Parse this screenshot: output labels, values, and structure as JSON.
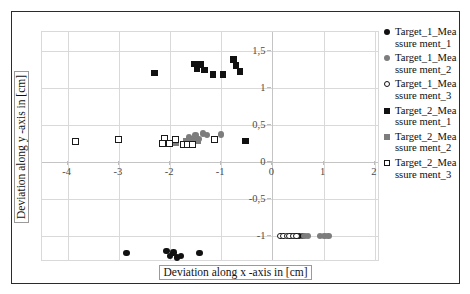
{
  "chart_data": {
    "type": "scatter",
    "title": "",
    "xlabel": "Deviation along x -axis in [cm]",
    "ylabel": "Deviation along y -axis in [cm]",
    "xlim": [
      -4.5,
      2.1
    ],
    "ylim": [
      -1.35,
      1.75
    ],
    "xticks": [
      -4,
      -3,
      -2,
      -1,
      0,
      1,
      2
    ],
    "xticklabels": [
      "-4",
      "-3",
      "-2",
      "-1",
      "0",
      "1",
      "2"
    ],
    "yticks": [
      -1,
      -0.5,
      0,
      0.5,
      1,
      1.5
    ],
    "yticklabels": [
      "-1",
      "-0,5",
      "0",
      "0,5",
      "1",
      "1,5"
    ],
    "grid": true,
    "legend_position": "right",
    "series": [
      {
        "name": "Target_1_Meassurement_1",
        "label": "Target_1_Meassurement_1",
        "marker": "circle-filled-black",
        "color": "#111111",
        "size": 6.5,
        "points": [
          [
            -2.85,
            -1.23
          ],
          [
            -2.07,
            -1.2
          ],
          [
            -2.0,
            -1.27
          ],
          [
            -1.93,
            -1.22
          ],
          [
            -1.86,
            -1.29
          ],
          [
            -1.79,
            -1.27
          ],
          [
            -1.42,
            -1.23
          ],
          [
            0.36,
            -1.0
          ],
          [
            0.45,
            -1.0
          ],
          [
            0.52,
            -1.0
          ],
          [
            0.6,
            -1.0
          ]
        ]
      },
      {
        "name": "Target_1_Meassurement_2",
        "label": "Target_1_Meassurement_2",
        "marker": "circle-filled-gray",
        "color": "#7d7d7d",
        "size": 6.5,
        "points": [
          [
            0.63,
            -1.0
          ],
          [
            0.69,
            -1.0
          ],
          [
            0.93,
            -1.0
          ],
          [
            1.02,
            -1.0
          ],
          [
            1.09,
            -1.0
          ],
          [
            -1.63,
            0.33
          ],
          [
            -1.57,
            0.3
          ],
          [
            -1.5,
            0.36
          ],
          [
            -1.44,
            0.31
          ],
          [
            -1.36,
            0.38
          ],
          [
            -1.28,
            0.36
          ],
          [
            -1.0,
            0.37
          ]
        ]
      },
      {
        "name": "Target_1_Meassurement_3",
        "label": "Target_1_Meassurement_3",
        "marker": "circle-open",
        "color": "#1a1a1a",
        "size": 6.5,
        "points": [
          [
            0.16,
            -1.0
          ],
          [
            0.22,
            -1.0
          ],
          [
            0.28,
            -1.0
          ],
          [
            0.33,
            -1.0
          ],
          [
            0.4,
            -1.0
          ],
          [
            0.47,
            -1.0
          ]
        ]
      },
      {
        "name": "Target_2_Meassurement_1",
        "label": "Target_2_Meassurement_1",
        "marker": "square-filled-black",
        "color": "#111111",
        "size": 6.5,
        "points": [
          [
            -2.3,
            1.2
          ],
          [
            -1.52,
            1.32
          ],
          [
            -1.47,
            1.25
          ],
          [
            -1.4,
            1.31
          ],
          [
            -1.33,
            1.24
          ],
          [
            -1.16,
            1.18
          ],
          [
            -0.97,
            1.18
          ],
          [
            -0.76,
            1.38
          ],
          [
            -0.71,
            1.3
          ],
          [
            -0.63,
            1.22
          ],
          [
            -0.53,
            0.28
          ]
        ]
      },
      {
        "name": "Target_2_Meassurement_2",
        "label": "Target_2_Meassurement_2",
        "marker": "square-filled-gray",
        "color": "#7d7d7d",
        "size": 6.5,
        "points": [
          [
            -1.68,
            0.28
          ],
          [
            -1.6,
            0.3
          ],
          [
            -1.53,
            0.3
          ],
          [
            -1.46,
            0.28
          ],
          [
            -1.88,
            0.26
          ]
        ]
      },
      {
        "name": "Target_2_Meassurement_3",
        "label": "Target_2_Meassurement_3",
        "marker": "square-open",
        "color": "#1a1a1a",
        "size": 7,
        "points": [
          [
            -3.84,
            0.27
          ],
          [
            -3.0,
            0.3
          ],
          [
            -2.1,
            0.31
          ],
          [
            -2.15,
            0.25
          ],
          [
            -2.01,
            0.25
          ],
          [
            -1.9,
            0.3
          ],
          [
            -1.74,
            0.24
          ],
          [
            -1.66,
            0.24
          ],
          [
            -1.56,
            0.23
          ],
          [
            -1.14,
            0.3
          ]
        ]
      }
    ]
  },
  "legend": {
    "entries": [
      {
        "label": "Target_1_Meassure ment_1",
        "marker": "circle-filled-black"
      },
      {
        "label": "Target_1_Meassure ment_2",
        "marker": "circle-filled-gray"
      },
      {
        "label": "Target_1_Meassure ment_3",
        "marker": "circle-open"
      },
      {
        "label": "Target_2_Meassure ment_1",
        "marker": "square-filled-black"
      },
      {
        "label": "Target_2_Meassure ment_2",
        "marker": "square-filled-gray"
      },
      {
        "label": "Target_2_Meassure ment_3",
        "marker": "square-open"
      }
    ]
  }
}
